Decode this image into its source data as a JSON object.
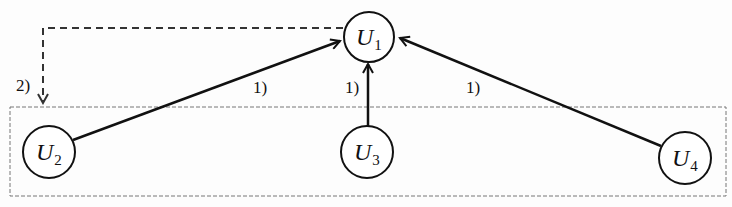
{
  "diagram": {
    "nodes": [
      {
        "id": "U1",
        "letter": "U",
        "sub": "1",
        "cx": 369,
        "cy": 37,
        "r": 25
      },
      {
        "id": "U2",
        "letter": "U",
        "sub": "2",
        "cx": 49,
        "cy": 152,
        "r": 26
      },
      {
        "id": "U3",
        "letter": "U",
        "sub": "3",
        "cx": 367,
        "cy": 152,
        "r": 26
      },
      {
        "id": "U4",
        "letter": "U",
        "sub": "4",
        "cx": 685,
        "cy": 158,
        "r": 26
      }
    ],
    "edges": [
      {
        "from": "U2",
        "to": "U1",
        "label": "1)",
        "style": "solid"
      },
      {
        "from": "U3",
        "to": "U1",
        "label": "1)",
        "style": "solid"
      },
      {
        "from": "U4",
        "to": "U1",
        "label": "1)",
        "style": "solid"
      },
      {
        "from": "U1",
        "to": "group",
        "label": "2)",
        "style": "dashed"
      }
    ],
    "group": {
      "label": "",
      "members": [
        "U2",
        "U3",
        "U4"
      ],
      "style": "dashed"
    },
    "colors": {
      "stroke": "#111111",
      "group_border": "#777777",
      "background": "#fdfdfd"
    }
  }
}
